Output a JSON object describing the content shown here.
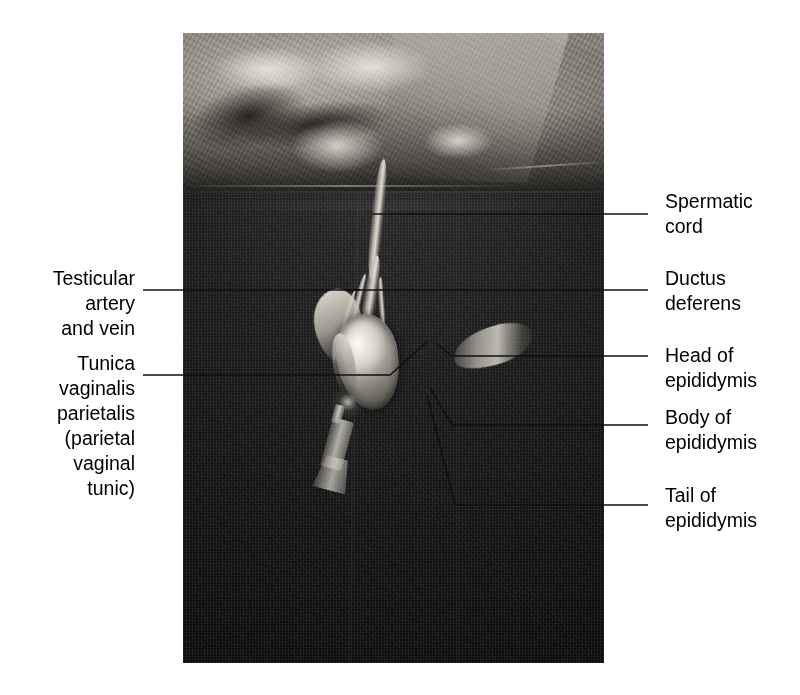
{
  "figure": {
    "type": "anatomical-photograph",
    "photo": {
      "left": 183,
      "top": 33,
      "width": 421,
      "height": 630,
      "palette": "grayscale"
    },
    "background_color": "#ffffff",
    "text_color": "#000000",
    "leader_color": "#1a1a1a"
  },
  "labels": {
    "spermatic_cord": "Spermatic\ncord",
    "ductus_deferens": "Ductus\ndeferens",
    "head_of_epididymis": "Head of\nepididymis",
    "body_of_epididymis": "Body of\nepididymis",
    "tail_of_epididymis": "Tail of\nepididymis",
    "testicular_artery_and_vein": "Testicular\nartery\nand vein",
    "tunica_vaginalis_parietalis": "Tunica\nvaginalis\nparietalis\n(parietal\nvaginal\ntunic)"
  },
  "callouts": [
    {
      "id": "spermatic-cord",
      "side": "right",
      "label_x": 665,
      "label_y": 189,
      "anchor_x": 372,
      "anchor_y": 214
    },
    {
      "id": "ductus-deferens",
      "side": "right",
      "label_x": 665,
      "label_y": 266,
      "anchor_x": 344,
      "anchor_y": 290
    },
    {
      "id": "head-of-epididymis",
      "side": "right",
      "label_x": 665,
      "label_y": 343,
      "anchor_x": 437,
      "anchor_y": 344
    },
    {
      "id": "body-of-epididymis",
      "side": "right",
      "label_x": 665,
      "label_y": 405,
      "anchor_x": 430,
      "anchor_y": 388
    },
    {
      "id": "tail-of-epididymis",
      "side": "right",
      "label_x": 665,
      "label_y": 483,
      "anchor_x": 427,
      "anchor_y": 395
    },
    {
      "id": "testicular-artery-and-vein",
      "side": "left",
      "label_x": 24,
      "label_y": 266,
      "anchor_x": 360,
      "anchor_y": 290
    },
    {
      "id": "tunica-vaginalis-parietalis",
      "side": "left",
      "label_x": 24,
      "label_y": 351,
      "anchor_x": 428,
      "anchor_y": 341
    }
  ]
}
